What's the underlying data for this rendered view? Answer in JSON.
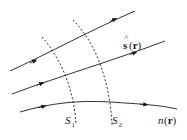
{
  "diagram": {
    "title": "",
    "rays": [
      {
        "name": "ray-1"
      },
      {
        "name": "ray-2"
      },
      {
        "name": "ray-3"
      }
    ],
    "surfaces": [
      {
        "name": "S1",
        "label_main": "S",
        "label_sub": "1"
      },
      {
        "name": "S2",
        "label_main": "S",
        "label_sub": "2"
      }
    ],
    "direction_label": {
      "hat": "^",
      "main": "s",
      "arg": "(r)"
    },
    "index_label": {
      "main": "n",
      "arg": "(r)"
    },
    "colors": {
      "stroke": "#1a1a1a",
      "background": "#ffffff"
    }
  }
}
